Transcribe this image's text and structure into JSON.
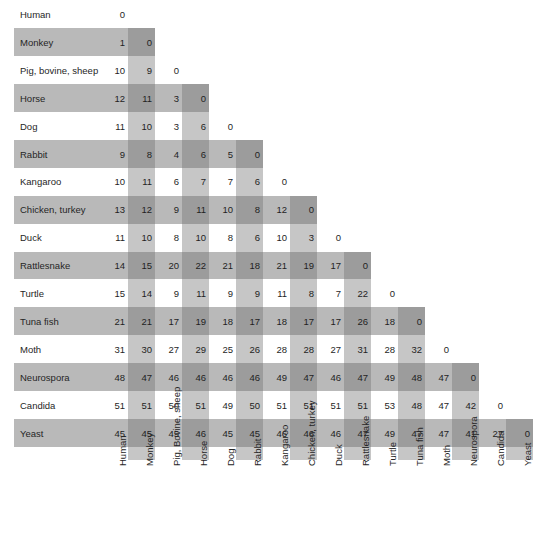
{
  "figure": {
    "kind": "lower-triangular-distance-matrix",
    "row_band_color": "#b9b9b9",
    "column_band_color": "#c6c6c6",
    "intersection_color": "#9c9c9c",
    "background_color": "#ffffff",
    "text_color": "#262626"
  },
  "chart_data": {
    "type": "heatmap",
    "title": "",
    "subtitle": "",
    "xlabel": "",
    "ylabel": "",
    "matrix_form": "lower triangular including zero diagonal",
    "row_labels": [
      "Human",
      "Monkey",
      "Pig, bovine, sheep",
      "Horse",
      "Dog",
      "Rabbit",
      "Kangaroo",
      "Chicken, turkey",
      "Duck",
      "Rattlesnake",
      "Turtle",
      "Tuna  fish",
      "Moth",
      "Neurospora",
      "Candida",
      "Yeast"
    ],
    "column_labels": [
      "Human",
      "Monkey",
      "Pig, Bovine, sheep",
      "Horse",
      "Dog",
      "Rabbit",
      "Kangaroo",
      "Chicken, turkey",
      "Duck",
      "Rattlesnake",
      "Turtle",
      "Tuna fish",
      "Moth",
      "Neurospora",
      "Candida",
      "Yeast"
    ],
    "rows": [
      {
        "label": "Human",
        "values": [
          0
        ]
      },
      {
        "label": "Monkey",
        "values": [
          1,
          0
        ]
      },
      {
        "label": "Pig, bovine, sheep",
        "values": [
          10,
          9,
          0
        ]
      },
      {
        "label": "Horse",
        "values": [
          12,
          11,
          3,
          0
        ]
      },
      {
        "label": "Dog",
        "values": [
          11,
          10,
          3,
          6,
          0
        ]
      },
      {
        "label": "Rabbit",
        "values": [
          9,
          8,
          4,
          6,
          5,
          0
        ]
      },
      {
        "label": "Kangaroo",
        "values": [
          10,
          11,
          6,
          7,
          7,
          6,
          0
        ]
      },
      {
        "label": "Chicken, turkey",
        "values": [
          13,
          12,
          9,
          11,
          10,
          8,
          12,
          0
        ]
      },
      {
        "label": "Duck",
        "values": [
          11,
          10,
          8,
          10,
          8,
          6,
          10,
          3,
          0
        ]
      },
      {
        "label": "Rattlesnake",
        "values": [
          14,
          15,
          20,
          22,
          21,
          18,
          21,
          19,
          17,
          0
        ]
      },
      {
        "label": "Turtle",
        "values": [
          15,
          14,
          9,
          11,
          9,
          9,
          11,
          8,
          7,
          22,
          0
        ]
      },
      {
        "label": "Tuna  fish",
        "values": [
          21,
          21,
          17,
          19,
          18,
          17,
          18,
          17,
          17,
          26,
          18,
          0
        ]
      },
      {
        "label": "Moth",
        "values": [
          31,
          30,
          27,
          29,
          25,
          26,
          28,
          28,
          27,
          31,
          28,
          32,
          0
        ]
      },
      {
        "label": "Neurospora",
        "values": [
          48,
          47,
          46,
          46,
          46,
          46,
          49,
          47,
          46,
          47,
          49,
          48,
          47,
          0
        ]
      },
      {
        "label": "Candida",
        "values": [
          51,
          51,
          50,
          51,
          49,
          50,
          51,
          51,
          51,
          51,
          53,
          48,
          47,
          42,
          0
        ]
      },
      {
        "label": "Yeast",
        "values": [
          45,
          45,
          45,
          46,
          45,
          45,
          46,
          46,
          46,
          47,
          49,
          47,
          47,
          41,
          27,
          0
        ]
      }
    ],
    "legend": [],
    "annotations": [],
    "grid": false
  }
}
